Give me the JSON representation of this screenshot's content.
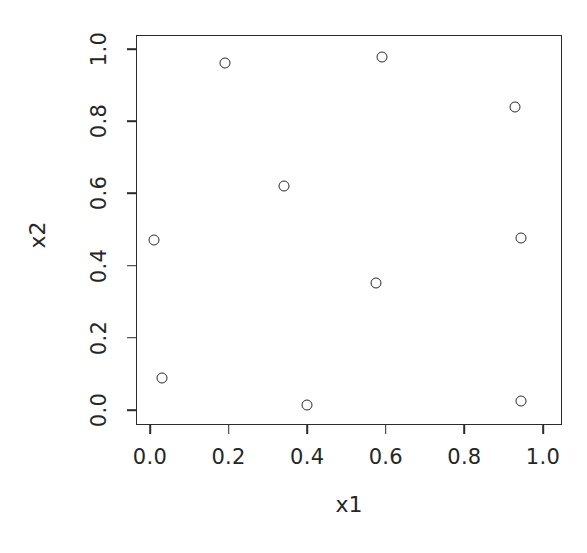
{
  "chart_data": {
    "type": "scatter",
    "title": "",
    "xlabel": "x1",
    "ylabel": "x2",
    "xlim": [
      -0.035,
      1.05
    ],
    "ylim": [
      -0.035,
      1.045
    ],
    "grid": false,
    "legend": null,
    "marker": "open-circle",
    "marker_color": "#2b2b2b",
    "xticks": [
      "0.0",
      "0.2",
      "0.4",
      "0.6",
      "0.8",
      "1.0"
    ],
    "xtick_values": [
      0.0,
      0.2,
      0.4,
      0.6,
      0.8,
      1.0
    ],
    "yticks": [
      "0.0",
      "0.2",
      "0.4",
      "0.6",
      "0.8",
      "1.0"
    ],
    "ytick_values": [
      0.0,
      0.2,
      0.4,
      0.6,
      0.8,
      1.0
    ],
    "points": [
      {
        "x": 0.19,
        "y": 0.96
      },
      {
        "x": 0.59,
        "y": 0.977
      },
      {
        "x": 0.93,
        "y": 0.838
      },
      {
        "x": 0.34,
        "y": 0.621
      },
      {
        "x": 0.01,
        "y": 0.472
      },
      {
        "x": 0.945,
        "y": 0.477
      },
      {
        "x": 0.575,
        "y": 0.352
      },
      {
        "x": 0.03,
        "y": 0.09
      },
      {
        "x": 0.945,
        "y": 0.024
      },
      {
        "x": 0.4,
        "y": 0.013
      }
    ],
    "x_values": [
      0.19,
      0.59,
      0.93,
      0.34,
      0.01,
      0.945,
      0.575,
      0.03,
      0.945,
      0.4
    ],
    "y_values": [
      0.96,
      0.977,
      0.838,
      0.621,
      0.472,
      0.477,
      0.352,
      0.09,
      0.024,
      0.013
    ]
  }
}
